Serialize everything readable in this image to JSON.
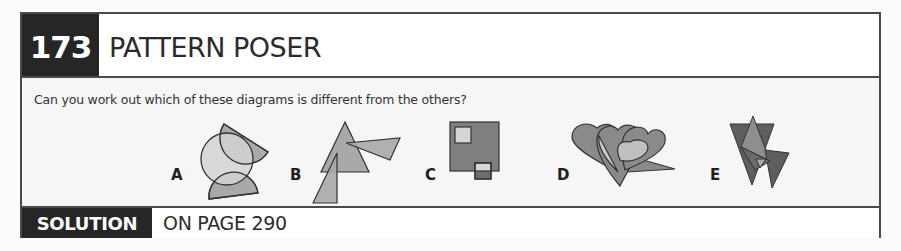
{
  "puzzle": {
    "number": "173",
    "title": "PATTERN POSER",
    "question": "Can you work out which of these diagrams is different from the others?",
    "options": [
      {
        "label": "A",
        "shapes": [
          "circle",
          "semicircle",
          "semicircle"
        ]
      },
      {
        "label": "B",
        "shapes": [
          "triangle",
          "triangle",
          "triangle"
        ]
      },
      {
        "label": "C",
        "shapes": [
          "square",
          "square",
          "square"
        ]
      },
      {
        "label": "D",
        "shapes": [
          "heart",
          "heart",
          "heart",
          "triangle"
        ]
      },
      {
        "label": "E",
        "shapes": [
          "triangle",
          "triangle",
          "triangle",
          "triangle"
        ]
      }
    ]
  },
  "solution": {
    "label": "SOLUTION",
    "text": "ON PAGE 290"
  },
  "colors": {
    "dark_block": "#262626",
    "frame": "#4a4a4a",
    "shape_light": "#d4d4d4",
    "shape_mid": "#a9a9a9",
    "shape_dark": "#7a7a7a",
    "shape_darker": "#5a5a5a"
  }
}
